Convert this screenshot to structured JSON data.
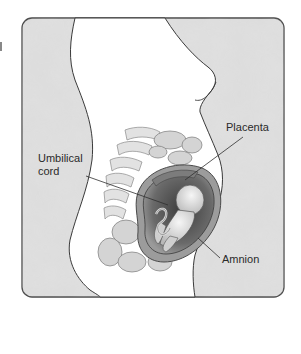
{
  "figure": {
    "labels": {
      "placenta": "Placenta",
      "umbilical_cord": "Umbilical cord",
      "amnion": "Amnion"
    },
    "colors": {
      "frame_fill": "#dedede",
      "frame_stroke": "#4a4a4a",
      "body_fill": "#ffffff",
      "line": "#333333",
      "uterus_wall": "#8a8a8a",
      "fetus": "#e6e6e6",
      "dark_tissue": "#5a5a5a"
    }
  }
}
